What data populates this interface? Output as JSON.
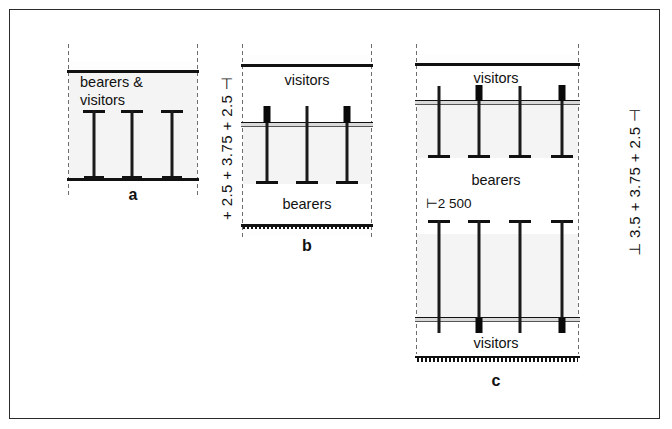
{
  "figure": {
    "kind": "structural-section-diagram",
    "panels": [
      "a",
      "b",
      "c"
    ]
  },
  "panel_a": {
    "key": "a",
    "caption": "a",
    "labels": {
      "line1": "bearers &",
      "line2": "visitors"
    },
    "column_count": 3,
    "storeys": 1
  },
  "panel_b": {
    "key": "b",
    "caption": "b",
    "labels": {
      "top": "visitors",
      "bottom": "bearers"
    },
    "column_count": 3,
    "storeys": 1
  },
  "panel_c": {
    "key": "c",
    "caption": "c",
    "labels": {
      "top": "visitors",
      "middle": "bearers",
      "bottom": "visitors"
    },
    "dimension_note": "⊢2 500",
    "column_count_upper": 4,
    "column_count_lower": 4,
    "storeys": 2
  },
  "dimensions": {
    "middle_stack": {
      "text": "+ 2.5 + 3.75 + 2.5 ⊣",
      "segments": [
        "2.5",
        "3.75",
        "2.5"
      ],
      "unit": "m"
    },
    "right_stack": {
      "text": "⊥ 3.5 + 3.75 + 2.5 ⊣",
      "segments": [
        "3.5",
        "3.75",
        "2.5"
      ],
      "unit": "m"
    }
  },
  "colors": {
    "ink": "#111111",
    "frame": "#2b2b2b",
    "fill": "#f4f4f4",
    "centerline": "#6e6e6e"
  }
}
